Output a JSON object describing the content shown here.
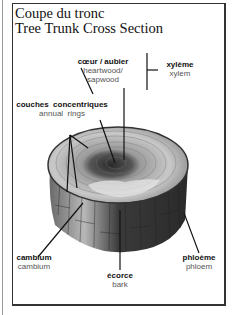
{
  "title": {
    "french": "Coupe du tronc",
    "english": "Tree Trunk Cross Section"
  },
  "labels": {
    "heartwood": {
      "fr": "cœur / aubier",
      "en1": "heartwood/",
      "en2": "sapwood"
    },
    "xylem": {
      "fr": "xylème",
      "en": "xylem"
    },
    "rings": {
      "fr": "couches  concentriques",
      "en": "annual  rings"
    },
    "cambium": {
      "fr": "cambium",
      "en": "cambium"
    },
    "bark": {
      "fr": "écorce",
      "en": "bark"
    },
    "phloem": {
      "fr": "phloème",
      "en": "phloem"
    }
  },
  "colors": {
    "frame": "#333333",
    "label_fr": "#111111",
    "label_en": "#555555",
    "bark_dark": "#3a3a3a",
    "wood_light": "#d8d8d8"
  }
}
